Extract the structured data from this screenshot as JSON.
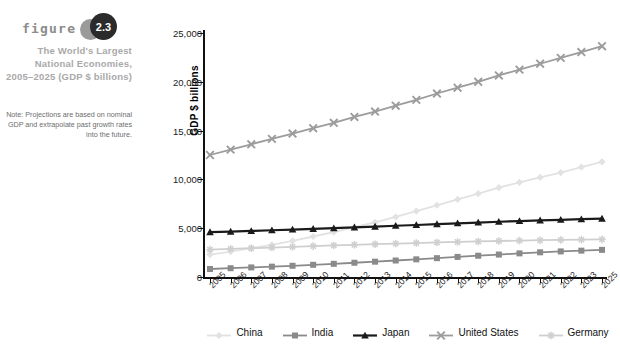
{
  "figure": {
    "word": "figure",
    "number": "2.3",
    "title": "The World's Largest National Economies, 2005–2025 (GDP $ billions)",
    "note": "Note: Projections are based on nominal GDP and extrapolate past growth rates into the future."
  },
  "colors": {
    "china": "#e2e2e2",
    "india": "#8a8a8a",
    "japan": "#1a1a1a",
    "united_states": "#9c9c9c",
    "germany": "#cfcfcf",
    "axis": "#111111",
    "title_gray": "#a9a9a9",
    "badge_dark": "#2b2b2b",
    "badge_gray": "#9a9a9a",
    "background": "#ffffff"
  },
  "chart_data": {
    "type": "line",
    "title": "The World's Largest National Economies, 2005–2025 (GDP $ billions)",
    "xlabel": "",
    "ylabel": "GDP $ billions",
    "ylim": [
      0,
      25000
    ],
    "yticks": [
      0,
      5000,
      10000,
      15000,
      20000,
      25000
    ],
    "ytick_labels": [
      "0",
      "5,000",
      "10,000",
      "15,000",
      "20,000",
      "25,000"
    ],
    "grid": false,
    "legend_position": "bottom",
    "categories": [
      "2005",
      "2006",
      "2007",
      "2008",
      "2009",
      "2010",
      "2011",
      "2012",
      "2013",
      "2014",
      "2015",
      "2016",
      "2017",
      "2018",
      "2019",
      "2020",
      "2021",
      "2022",
      "2023",
      "2025"
    ],
    "series": [
      {
        "name": "China",
        "color": "#e2e2e2",
        "marker": "diamond",
        "values": [
          2300,
          2600,
          2950,
          3300,
          3700,
          4150,
          4600,
          5100,
          5600,
          6150,
          6750,
          7350,
          7950,
          8550,
          9150,
          9700,
          10200,
          10700,
          11250,
          11800
        ]
      },
      {
        "name": "India",
        "color": "#8a8a8a",
        "marker": "square",
        "values": [
          820,
          900,
          980,
          1060,
          1150,
          1250,
          1350,
          1460,
          1570,
          1690,
          1810,
          1930,
          2060,
          2180,
          2300,
          2420,
          2530,
          2620,
          2700,
          2780
        ]
      },
      {
        "name": "Japan",
        "color": "#1a1a1a",
        "marker": "triangle",
        "values": [
          4600,
          4650,
          4720,
          4790,
          4860,
          4930,
          5000,
          5080,
          5160,
          5250,
          5330,
          5420,
          5500,
          5580,
          5660,
          5730,
          5800,
          5860,
          5920,
          5980
        ]
      },
      {
        "name": "United States",
        "color": "#9c9c9c",
        "marker": "x",
        "values": [
          12500,
          13050,
          13600,
          14150,
          14700,
          15250,
          15800,
          16400,
          16950,
          17550,
          18150,
          18800,
          19400,
          20000,
          20650,
          21250,
          21850,
          22450,
          23050,
          23650
        ]
      },
      {
        "name": "Germany",
        "color": "#cfcfcf",
        "marker": "asterisk",
        "values": [
          2800,
          2880,
          2950,
          3020,
          3090,
          3160,
          3230,
          3300,
          3360,
          3420,
          3480,
          3540,
          3590,
          3640,
          3690,
          3730,
          3770,
          3800,
          3830,
          3860
        ]
      }
    ]
  },
  "legend": {
    "items": [
      {
        "label": "China"
      },
      {
        "label": "India"
      },
      {
        "label": "Japan"
      },
      {
        "label": "United States"
      },
      {
        "label": "Germany"
      }
    ]
  }
}
